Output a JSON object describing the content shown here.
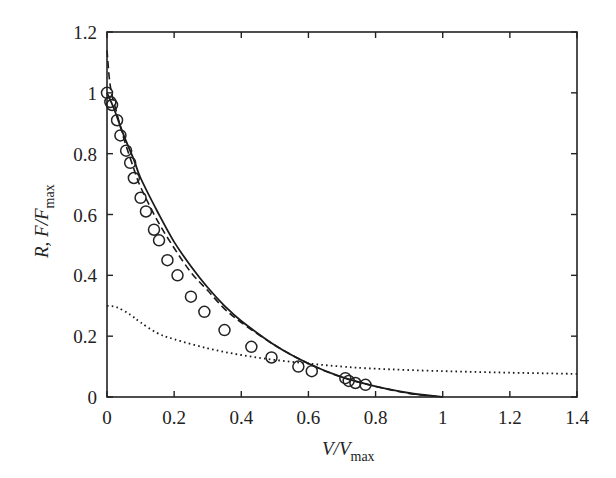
{
  "chart_data": {
    "type": "line",
    "title": "",
    "xlabel": "V/V_max",
    "xlabel_parts": {
      "main": "V/V",
      "sub": "max"
    },
    "ylabel": "R, F/F_max",
    "ylabel_parts": {
      "main": "R, F/F",
      "sub": "max"
    },
    "xlim": [
      0,
      1.4
    ],
    "ylim": [
      0,
      1.2
    ],
    "grid": false,
    "legend": null,
    "x_ticks": [
      0,
      0.2,
      0.4,
      0.6,
      0.8,
      1,
      1.2,
      1.4
    ],
    "x_tick_labels": [
      "0",
      "0.2",
      "0.4",
      "0.6",
      "0.8",
      "1",
      "1.2",
      "1.4"
    ],
    "y_ticks": [
      0,
      0.2,
      0.4,
      0.6,
      0.8,
      1,
      1.2
    ],
    "y_tick_labels": [
      "0",
      "0.2",
      "0.4",
      "0.6",
      "0.8",
      "1",
      "1.2"
    ],
    "series": [
      {
        "name": "data (F/F_max)",
        "style": "open-circles",
        "x": [
          0.0,
          0.01,
          0.015,
          0.03,
          0.04,
          0.057,
          0.069,
          0.08,
          0.1,
          0.116,
          0.14,
          0.155,
          0.18,
          0.21,
          0.25,
          0.29,
          0.35,
          0.43,
          0.49,
          0.57,
          0.61,
          0.71,
          0.72,
          0.74,
          0.77
        ],
        "y": [
          1.0,
          0.97,
          0.96,
          0.91,
          0.86,
          0.81,
          0.77,
          0.72,
          0.655,
          0.61,
          0.55,
          0.515,
          0.45,
          0.4,
          0.33,
          0.28,
          0.22,
          0.165,
          0.13,
          0.1,
          0.085,
          0.062,
          0.053,
          0.046,
          0.04
        ]
      },
      {
        "name": "fit (solid)",
        "style": "solid",
        "x": [
          0,
          0.02,
          0.05,
          0.08,
          0.1,
          0.15,
          0.2,
          0.25,
          0.3,
          0.35,
          0.4,
          0.5,
          0.6,
          0.7,
          0.8,
          0.9,
          1.0
        ],
        "y": [
          1.0,
          0.95,
          0.86,
          0.78,
          0.72,
          0.61,
          0.51,
          0.43,
          0.36,
          0.3,
          0.25,
          0.17,
          0.11,
          0.065,
          0.035,
          0.013,
          0.0
        ]
      },
      {
        "name": "model (dashed)",
        "style": "dashed",
        "x": [
          0,
          0.01,
          0.03,
          0.05,
          0.08,
          0.1,
          0.15,
          0.2,
          0.25,
          0.3,
          0.35,
          0.4,
          0.5,
          0.6,
          0.7,
          0.8,
          0.9,
          1.0
        ],
        "y": [
          1.14,
          1.02,
          0.93,
          0.85,
          0.75,
          0.69,
          0.58,
          0.49,
          0.41,
          0.35,
          0.29,
          0.245,
          0.17,
          0.11,
          0.065,
          0.035,
          0.012,
          0.0
        ]
      },
      {
        "name": "R (dotted)",
        "style": "dotted",
        "x": [
          0,
          0.03,
          0.07,
          0.1,
          0.15,
          0.2,
          0.3,
          0.4,
          0.5,
          0.6,
          0.7,
          0.8,
          1.0,
          1.2,
          1.4
        ],
        "y": [
          0.3,
          0.295,
          0.27,
          0.245,
          0.21,
          0.19,
          0.16,
          0.138,
          0.122,
          0.11,
          0.1,
          0.093,
          0.085,
          0.08,
          0.076
        ]
      }
    ]
  }
}
